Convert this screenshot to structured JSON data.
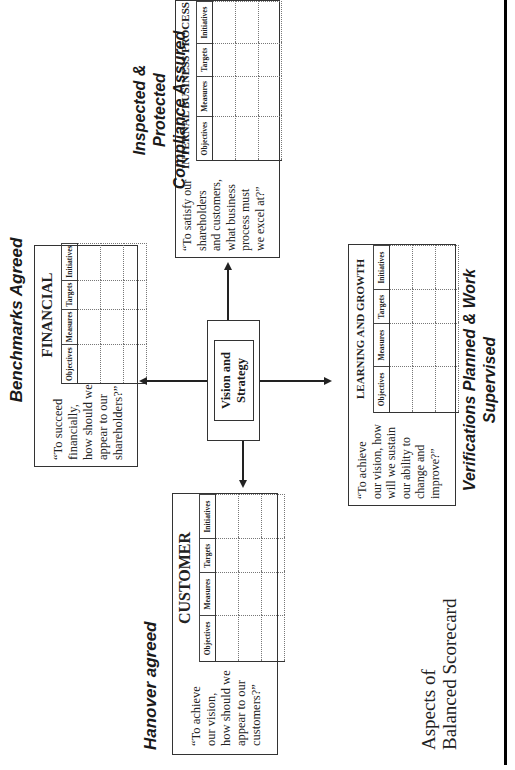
{
  "labels": {
    "top": "Benchmarks Agreed",
    "left": "Hanover agreed",
    "right_line1": "Inspected & Protected",
    "right_line2": "Compliance Assured",
    "bottom_line1": "Verifications Planned & Work",
    "bottom_line2": "Supervised"
  },
  "footer": {
    "line1": "Aspects of",
    "line2": "Balanced Scorecard"
  },
  "center": {
    "line1": "Vision and",
    "line2": "Strategy"
  },
  "columns": [
    "Objectives",
    "Measures",
    "Targets",
    "Initiatives"
  ],
  "perspectives": {
    "financial": {
      "title": "FINANCIAL",
      "quote": [
        "“To succeed",
        "financially,",
        "how should we",
        "appear to our",
        "shareholders?”"
      ]
    },
    "customer": {
      "title": "CUSTOMER",
      "quote": [
        "“To achieve",
        "our vision,",
        "how should we",
        "appear to our",
        "customers?”"
      ]
    },
    "internal": {
      "title": "INTERNAL BUSINESS PROCESS",
      "quote": [
        "“To satisfy our",
        "shareholders",
        "and customers,",
        "what business",
        "process must",
        "we excel at?”"
      ]
    },
    "learning": {
      "title": "LEARNING AND GROWTH",
      "quote": [
        "“To achieve",
        "our vision, how",
        "will we sustain",
        "our ability to",
        "change and",
        "improve?”"
      ]
    }
  },
  "colors": {
    "ink": "#1a1a1a",
    "border": "#333333",
    "background": "#ffffff"
  }
}
